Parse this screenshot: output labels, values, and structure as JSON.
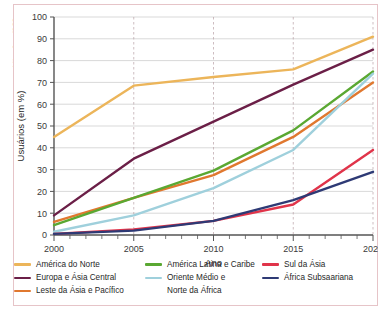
{
  "credit": "Adilson Secco/ID/BR",
  "chart_data": {
    "type": "line",
    "title": "",
    "xlabel": "Ano",
    "ylabel": "Usuários (em %)",
    "x": [
      2000,
      2005,
      2010,
      2015,
      2020
    ],
    "xlim": [
      2000,
      2020
    ],
    "ylim": [
      0,
      100
    ],
    "xticks": [
      "2000",
      "2005",
      "2010",
      "2015",
      "2020"
    ],
    "yticks": [
      "0",
      "10",
      "20",
      "30",
      "40",
      "50",
      "60",
      "70",
      "80",
      "90",
      "100"
    ],
    "ytick_step": 10,
    "minor_xticks_per_interval": 5,
    "grid": "horizontal-solid-plus-vertical-dashed",
    "legend_position": "below-axes",
    "legend_columns": 3,
    "series": [
      {
        "name": "América do Norte",
        "color": "#ecb55a",
        "values": [
          45,
          68.5,
          72.5,
          76,
          91
        ]
      },
      {
        "name": "Europa e Ásia Central",
        "color": "#6b1f47",
        "values": [
          9,
          35,
          52,
          69,
          85
        ]
      },
      {
        "name": "Leste da Ásia e Pacífico",
        "color": "#e0782f",
        "values": [
          6,
          17,
          27.5,
          45,
          70
        ]
      },
      {
        "name": "América Latina e Caribe",
        "color": "#5aa832",
        "values": [
          4.5,
          17,
          29.5,
          48,
          75
        ]
      },
      {
        "name": "Oriente Médio e Norte da África",
        "color": "#9fd0dc",
        "values": [
          1.5,
          9,
          21.5,
          39,
          74
        ]
      },
      {
        "name": "Sul da Ásia",
        "color": "#e0344a",
        "values": [
          0.5,
          2.5,
          6.5,
          14,
          39
        ]
      },
      {
        "name": "África Subsaariana",
        "color": "#2e3a75",
        "values": [
          0.5,
          2,
          6.5,
          16,
          29
        ]
      }
    ]
  },
  "legend": {
    "columns": [
      [
        {
          "label": "América do Norte",
          "color": "#ecb55a"
        },
        {
          "label": "Europa e Ásia Central",
          "color": "#6b1f47"
        },
        {
          "label": "Leste da Ásia e Pacífico",
          "color": "#e0782f"
        }
      ],
      [
        {
          "label": "América Latina e Caribe",
          "color": "#5aa832"
        },
        {
          "label": "Oriente Médio e",
          "color": "#9fd0dc"
        },
        {
          "label": "Norte da África",
          "color": null
        }
      ],
      [
        {
          "label": "Sul da Ásia",
          "color": "#e0344a"
        },
        {
          "label": "África Subsaariana",
          "color": "#2e3a75"
        }
      ]
    ]
  }
}
